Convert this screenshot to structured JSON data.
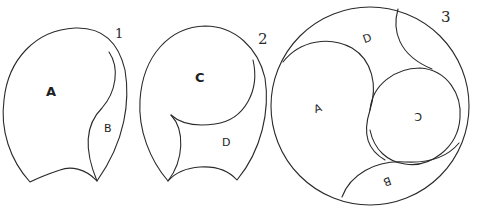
{
  "figures": [
    {
      "number": "1",
      "regions": [
        {
          "label": "A"
        },
        {
          "label": "B"
        }
      ]
    },
    {
      "number": "2",
      "regions": [
        {
          "label": "C"
        },
        {
          "label": "D"
        }
      ]
    },
    {
      "number": "3",
      "regions": [
        {
          "label": "A"
        },
        {
          "label": "D"
        },
        {
          "label": "C"
        },
        {
          "label": "B"
        }
      ]
    }
  ],
  "colors": {
    "line": "#2a2a2a",
    "background": "#ffffff"
  }
}
